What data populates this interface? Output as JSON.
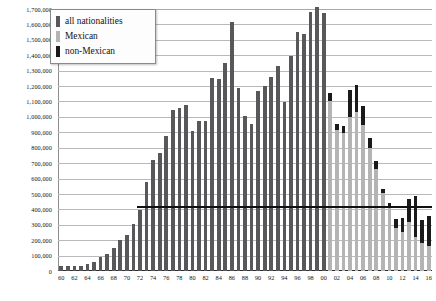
{
  "chart_data": {
    "type": "bar",
    "title": "",
    "subtitle": "",
    "xlabel": "",
    "ylabel": "",
    "stacked": true,
    "grid": true,
    "legend_position": "top-left",
    "ylim": [
      0,
      1700000
    ],
    "ytick_step": 100000,
    "ytick_labels": [
      "1,700,000",
      "1,600,000",
      "1,500,000",
      "1,400,000",
      "1,300,000",
      "1,200,000",
      "1,100,000",
      "1,000,000",
      "900,000",
      "800,000",
      "700,000",
      "600,000",
      "500,000",
      "400,000",
      "300,000",
      "200,000",
      "100,000",
      "0"
    ],
    "ytick_values": [
      1700000,
      1600000,
      1500000,
      1400000,
      1300000,
      1200000,
      1100000,
      1000000,
      900000,
      800000,
      700000,
      600000,
      500000,
      400000,
      300000,
      200000,
      100000,
      0
    ],
    "categories": [
      "60",
      "61",
      "62",
      "63",
      "64",
      "65",
      "66",
      "67",
      "68",
      "69",
      "70",
      "71",
      "72",
      "73",
      "74",
      "75",
      "76",
      "77",
      "78",
      "79",
      "80",
      "81",
      "82",
      "83",
      "84",
      "85",
      "86",
      "87",
      "88",
      "89",
      "90",
      "91",
      "92",
      "93",
      "94",
      "95",
      "96",
      "97",
      "98",
      "99",
      "00",
      "01",
      "02",
      "03",
      "04",
      "05",
      "06",
      "07",
      "08",
      "09",
      "10",
      "11",
      "12",
      "13",
      "14",
      "15",
      "16"
    ],
    "xtick_labels_shown": [
      "60",
      "62",
      "64",
      "66",
      "68",
      "70",
      "72",
      "74",
      "76",
      "78",
      "80",
      "82",
      "84",
      "86",
      "88",
      "90",
      "92",
      "94",
      "96",
      "98",
      "00",
      "02",
      "04",
      "06",
      "08",
      "10",
      "12",
      "14",
      "16"
    ],
    "annotations": [
      {
        "name": "reference-line",
        "label": "",
        "value": 420000,
        "from_category": "72",
        "to_category": "16"
      }
    ],
    "series": [
      {
        "name": "all nationalities",
        "color": "#58585a",
        "values": [
          29651,
          29651,
          30272,
          30272,
          43844,
          55349,
          89751,
          108327,
          151705,
          201636,
          231116,
          302517,
          396495,
          576823,
          718740,
          766600,
          875915,
          1042215,
          1057977,
          1076418,
          910361,
          975780,
          970246,
          1251357,
          1246981,
          1348749,
          1615854,
          1190488,
          1008145,
          954243,
          1169939,
          1197875,
          1258481,
          1327261,
          1094719,
          1394554,
          1549876,
          1536520,
          1679439,
          1714035,
          1676438,
          null,
          null,
          null,
          null,
          null,
          null,
          null,
          null,
          null,
          null,
          null,
          null,
          null,
          null,
          null,
          null
        ]
      },
      {
        "name": "Mexican",
        "color": "#b4b4b4",
        "values": [
          null,
          null,
          null,
          null,
          null,
          null,
          null,
          null,
          null,
          null,
          null,
          null,
          null,
          null,
          null,
          null,
          null,
          null,
          null,
          null,
          null,
          null,
          null,
          null,
          null,
          null,
          null,
          null,
          null,
          null,
          null,
          null,
          null,
          null,
          null,
          null,
          null,
          null,
          null,
          null,
          1600000,
          1100000,
          915000,
          895000,
          1000000,
          1030000,
          950000,
          800000,
          661000,
          503000,
          425000,
          277000,
          255000,
          320000,
          220000,
          180000,
          165000
        ]
      },
      {
        "name": "non-Mexican",
        "color": "#1a1a1a",
        "values": [
          null,
          null,
          null,
          null,
          null,
          null,
          null,
          null,
          null,
          null,
          null,
          null,
          null,
          null,
          null,
          null,
          null,
          null,
          null,
          null,
          null,
          null,
          null,
          null,
          null,
          null,
          null,
          null,
          null,
          null,
          null,
          null,
          null,
          null,
          null,
          null,
          null,
          null,
          null,
          null,
          76000,
          55000,
          40000,
          48000,
          175000,
          180000,
          120000,
          60000,
          52000,
          30000,
          15000,
          60000,
          90000,
          145000,
          265000,
          150000,
          195000
        ]
      }
    ]
  },
  "legend": {
    "items": [
      {
        "label": "all nationalities",
        "color": "#58585a"
      },
      {
        "label": "Mexican",
        "color": "#b4b4b4"
      },
      {
        "label": "non-Mexican",
        "color": "#1a1a1a"
      }
    ]
  }
}
